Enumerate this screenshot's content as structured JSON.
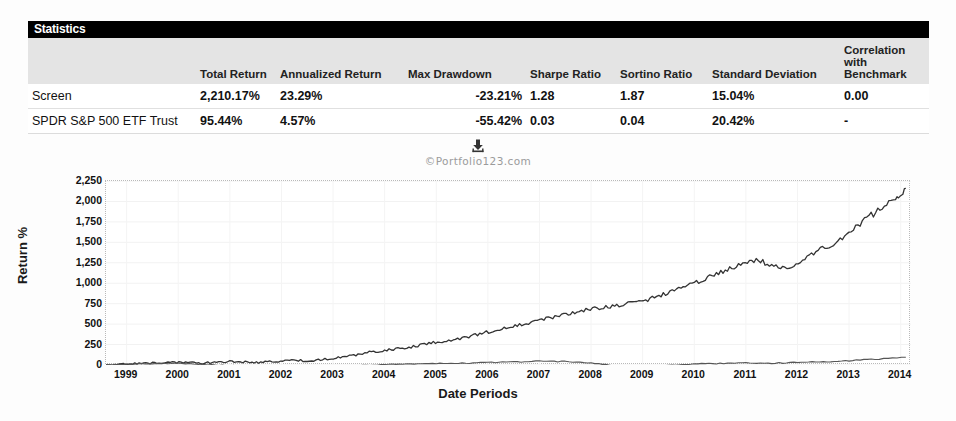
{
  "panel": {
    "title": "Statistics"
  },
  "table": {
    "columns": [
      "",
      "Total Return",
      "Annualized Return",
      "Max Drawdown",
      "Sharpe Ratio",
      "Sortino Ratio",
      "Standard Deviation",
      "Correlation with Benchmark"
    ],
    "rows": [
      {
        "name": "Screen",
        "total_return": "2,210.17%",
        "annualized_return": "23.29%",
        "max_drawdown": "-23.21%",
        "sharpe_ratio": "1.28",
        "sortino_ratio": "1.87",
        "standard_deviation": "15.04%",
        "correlation_with_benchmark": "0.00"
      },
      {
        "name": "SPDR S&P 500 ETF Trust",
        "total_return": "95.44%",
        "annualized_return": "4.57%",
        "max_drawdown": "-55.42%",
        "sharpe_ratio": "0.03",
        "sortino_ratio": "0.04",
        "standard_deviation": "20.42%",
        "correlation_with_benchmark": "-"
      }
    ]
  },
  "tools": {
    "download_icon": "download-icon",
    "watermark": "©Portfolio123.com"
  },
  "chart_data": {
    "type": "line",
    "title": "",
    "xlabel": "Date Periods",
    "ylabel": "Return %",
    "ylim": [
      0,
      2250
    ],
    "yticks": [
      2250,
      2000,
      1750,
      1500,
      1250,
      1000,
      750,
      500,
      250,
      0
    ],
    "ytick_labels": [
      "2,250",
      "2,000",
      "1,750",
      "1,500",
      "1,250",
      "1,000",
      "750",
      "500",
      "250",
      "0"
    ],
    "xlim": [
      1998.6,
      2014.2
    ],
    "xticks": [
      1999,
      2000,
      2001,
      2002,
      2003,
      2004,
      2005,
      2006,
      2007,
      2008,
      2009,
      2010,
      2011,
      2012,
      2013,
      2014
    ],
    "xtick_labels": [
      "1999",
      "2000",
      "2001",
      "2002",
      "2003",
      "2004",
      "2005",
      "2006",
      "2007",
      "2008",
      "2009",
      "2010",
      "2011",
      "2012",
      "2013",
      "2014"
    ],
    "grid": true,
    "legend": "none",
    "series": [
      {
        "name": "Screen",
        "color": "#333333",
        "x": [
          1998.6,
          1998.9,
          1999.2,
          1999.5,
          1999.8,
          2000.1,
          2000.4,
          2000.7,
          2001.0,
          2001.3,
          2001.6,
          2001.9,
          2002.2,
          2002.5,
          2002.8,
          2003.1,
          2003.4,
          2003.7,
          2004.0,
          2004.3,
          2004.6,
          2004.9,
          2005.2,
          2005.5,
          2005.8,
          2006.1,
          2006.4,
          2006.7,
          2007.0,
          2007.3,
          2007.6,
          2007.9,
          2008.2,
          2008.5,
          2008.8,
          2009.1,
          2009.4,
          2009.7,
          2010.0,
          2010.3,
          2010.6,
          2010.9,
          2011.2,
          2011.5,
          2011.8,
          2012.1,
          2012.4,
          2012.7,
          2013.0,
          2013.3,
          2013.6,
          2013.9,
          2014.1
        ],
        "y": [
          0,
          8,
          14,
          22,
          35,
          30,
          24,
          30,
          42,
          38,
          30,
          48,
          60,
          52,
          66,
          88,
          120,
          155,
          180,
          205,
          230,
          268,
          300,
          330,
          372,
          420,
          455,
          500,
          548,
          590,
          630,
          672,
          700,
          720,
          760,
          800,
          860,
          930,
          1000,
          1080,
          1150,
          1230,
          1290,
          1220,
          1180,
          1290,
          1400,
          1490,
          1600,
          1780,
          1900,
          2050,
          2160
        ]
      },
      {
        "name": "SPDR S&P 500 ETF Trust",
        "color": "#555555",
        "x": [
          1998.6,
          1999.0,
          1999.5,
          2000.0,
          2000.5,
          2001.0,
          2001.5,
          2002.0,
          2002.5,
          2003.0,
          2003.5,
          2004.0,
          2004.5,
          2005.0,
          2005.5,
          2006.0,
          2006.5,
          2007.0,
          2007.5,
          2008.0,
          2008.5,
          2009.0,
          2009.5,
          2010.0,
          2010.5,
          2011.0,
          2011.5,
          2012.0,
          2012.5,
          2013.0,
          2013.5,
          2014.1
        ],
        "y": [
          0,
          10,
          18,
          22,
          6,
          -8,
          -18,
          -14,
          -34,
          -30,
          -8,
          6,
          12,
          18,
          22,
          30,
          38,
          46,
          42,
          28,
          -14,
          -28,
          -4,
          14,
          18,
          28,
          22,
          30,
          40,
          52,
          72,
          95
        ]
      }
    ]
  }
}
